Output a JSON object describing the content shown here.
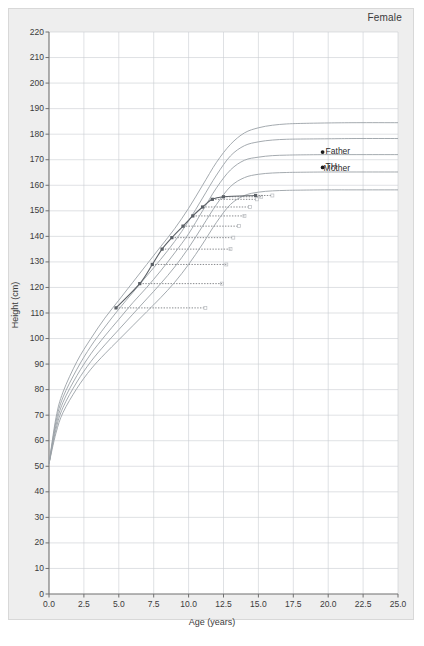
{
  "figure": {
    "sex_label": "Female",
    "xlabel": "Age (years)",
    "ylabel": "Height (cm)"
  },
  "annotations": {
    "father": "Father",
    "th": "TH",
    "mother": "Mother"
  },
  "colors": {
    "page_background": "#ffffff",
    "card_background": "#eeeeee",
    "plot_background": "#ffffff",
    "grid": "#c9cdd2",
    "axis": "#6f6f6f",
    "reference_curve": "#9aa0a6",
    "patient_curve": "#5b6066",
    "projection_line": "#55585c",
    "marker_point": "#1a1a1a",
    "text": "#3b3b3b"
  },
  "chart_data": {
    "type": "line",
    "title": "Female",
    "xlabel": "Age (years)",
    "ylabel": "Height (cm)",
    "xlim": [
      0.0,
      25.0
    ],
    "ylim": [
      0,
      220
    ],
    "xticks": [
      "0.0",
      "2.5",
      "5.0",
      "7.5",
      "10.0",
      "12.5",
      "15.0",
      "17.5",
      "20.0",
      "22.5",
      "25.0"
    ],
    "xtick_values": [
      0.0,
      2.5,
      5.0,
      7.5,
      10.0,
      12.5,
      15.0,
      17.5,
      20.0,
      22.5,
      25.0
    ],
    "yticks": [
      "0",
      "10",
      "20",
      "30",
      "40",
      "50",
      "60",
      "70",
      "80",
      "90",
      "100",
      "110",
      "120",
      "130",
      "140",
      "150",
      "160",
      "170",
      "180",
      "190",
      "200",
      "210",
      "220"
    ],
    "ytick_values": [
      0,
      10,
      20,
      30,
      40,
      50,
      60,
      70,
      80,
      90,
      100,
      110,
      120,
      130,
      140,
      150,
      160,
      170,
      180,
      190,
      200,
      210,
      220
    ],
    "grid": true,
    "legend_position": "inline-right",
    "series": [
      {
        "name": "reference-centile-1",
        "role": "reference",
        "adult_height": 184,
        "x": [
          0.0,
          0.5,
          1.0,
          2.0,
          3.0,
          4.0,
          5.0,
          6.0,
          7.0,
          8.0,
          9.0,
          10.0,
          11.0,
          12.0,
          13.0,
          14.0,
          15.0,
          16.0,
          17.0,
          18.0,
          20.0,
          22.0,
          25.0
        ],
        "y": [
          51.0,
          69.0,
          79.0,
          91.0,
          100.0,
          108.0,
          115.0,
          122.0,
          129.0,
          136.0,
          143.0,
          151.0,
          160.0,
          169.0,
          176.0,
          180.5,
          182.5,
          183.5,
          184.0,
          184.2,
          184.4,
          184.5,
          184.5
        ]
      },
      {
        "name": "reference-centile-2",
        "role": "reference",
        "adult_height": 178,
        "x": [
          0.0,
          0.5,
          1.0,
          2.0,
          3.0,
          4.0,
          5.0,
          6.0,
          7.0,
          8.0,
          9.0,
          10.0,
          11.0,
          12.0,
          13.0,
          14.0,
          15.0,
          16.0,
          17.0,
          18.0,
          20.0,
          22.0,
          25.0
        ],
        "y": [
          51.0,
          67.5,
          77.0,
          88.0,
          97.0,
          104.5,
          111.5,
          118.0,
          124.5,
          131.0,
          138.0,
          146.0,
          155.0,
          164.0,
          171.5,
          175.5,
          177.0,
          177.7,
          178.0,
          178.1,
          178.2,
          178.3,
          178.3
        ]
      },
      {
        "name": "reference-centile-3",
        "role": "reference",
        "adult_height": 172,
        "x": [
          0.0,
          0.5,
          1.0,
          2.0,
          3.0,
          4.0,
          5.0,
          6.0,
          7.0,
          8.0,
          9.0,
          10.0,
          11.0,
          12.0,
          13.0,
          14.0,
          15.0,
          16.0,
          17.0,
          18.0,
          20.0,
          22.0,
          25.0
        ],
        "y": [
          51.0,
          66.0,
          75.0,
          85.5,
          94.0,
          101.0,
          107.5,
          114.0,
          120.0,
          126.5,
          133.5,
          141.0,
          150.0,
          159.0,
          166.0,
          169.8,
          171.0,
          171.6,
          171.8,
          171.9,
          172.0,
          172.0,
          172.0
        ]
      },
      {
        "name": "reference-centile-4",
        "role": "reference",
        "adult_height": 165,
        "x": [
          0.0,
          0.5,
          1.0,
          2.0,
          3.0,
          4.0,
          5.0,
          6.0,
          7.0,
          8.0,
          9.0,
          10.0,
          11.0,
          12.0,
          13.0,
          14.0,
          15.0,
          16.0,
          17.0,
          18.0,
          20.0,
          22.0,
          25.0
        ],
        "y": [
          51.0,
          64.5,
          73.0,
          83.0,
          91.0,
          97.5,
          103.5,
          109.5,
          115.5,
          121.5,
          128.0,
          135.5,
          144.0,
          152.5,
          159.5,
          163.0,
          164.3,
          164.8,
          165.0,
          165.1,
          165.2,
          165.2,
          165.2
        ]
      },
      {
        "name": "reference-centile-5",
        "role": "reference",
        "adult_height": 158,
        "x": [
          0.0,
          0.5,
          1.0,
          2.0,
          3.0,
          4.0,
          5.0,
          6.0,
          7.0,
          8.0,
          9.0,
          10.0,
          11.0,
          12.0,
          13.0,
          14.0,
          15.0,
          16.0,
          17.0,
          18.0,
          20.0,
          22.0,
          25.0
        ],
        "y": [
          51.0,
          63.0,
          71.0,
          80.5,
          88.0,
          94.0,
          99.5,
          105.0,
          110.5,
          116.0,
          122.0,
          129.0,
          137.0,
          145.5,
          152.5,
          156.0,
          157.3,
          157.8,
          158.0,
          158.1,
          158.2,
          158.2,
          158.2
        ]
      },
      {
        "name": "patient-measurements",
        "role": "patient",
        "x": [
          4.8,
          6.5,
          7.4,
          8.1,
          8.8,
          9.6,
          10.3,
          11.0,
          11.7,
          12.5,
          14.8
        ],
        "y": [
          112.0,
          121.5,
          129.0,
          135.0,
          139.5,
          144.0,
          148.0,
          151.5,
          154.5,
          155.5,
          156.0
        ]
      }
    ],
    "points": [
      {
        "name": "Father",
        "x": 19.6,
        "y": 173.0
      },
      {
        "name": "TH",
        "x": 19.6,
        "y": 167.0
      }
    ],
    "projection_lines": [
      {
        "from_x": 4.8,
        "y": 112.0,
        "to_x": 11.2
      },
      {
        "from_x": 6.5,
        "y": 121.5,
        "to_x": 12.4
      },
      {
        "from_x": 7.4,
        "y": 129.0,
        "to_x": 12.7
      },
      {
        "from_x": 8.1,
        "y": 135.0,
        "to_x": 13.0
      },
      {
        "from_x": 8.8,
        "y": 139.5,
        "to_x": 13.2
      },
      {
        "from_x": 9.6,
        "y": 144.0,
        "to_x": 13.6
      },
      {
        "from_x": 10.3,
        "y": 148.0,
        "to_x": 14.0
      },
      {
        "from_x": 11.0,
        "y": 151.5,
        "to_x": 14.4
      },
      {
        "from_x": 11.7,
        "y": 154.5,
        "to_x": 14.9
      },
      {
        "from_x": 12.5,
        "y": 155.5,
        "to_x": 15.2
      },
      {
        "from_x": 14.8,
        "y": 156.0,
        "to_x": 16.0
      }
    ]
  }
}
